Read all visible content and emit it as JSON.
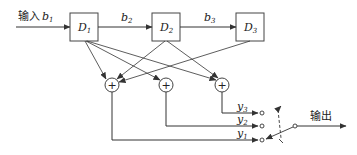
{
  "diagram": {
    "input_label": "输入",
    "input_var": "b",
    "input_sub": "1",
    "output_label": "输出",
    "registers": [
      {
        "name": "D",
        "sub": "1"
      },
      {
        "name": "D",
        "sub": "2"
      },
      {
        "name": "D",
        "sub": "3"
      }
    ],
    "links": [
      {
        "var": "b",
        "sub": "2"
      },
      {
        "var": "b",
        "sub": "3"
      }
    ],
    "adder_symbol": "+",
    "outputs": [
      {
        "var": "y",
        "sub": "3"
      },
      {
        "var": "y",
        "sub": "2"
      },
      {
        "var": "y",
        "sub": "1"
      }
    ],
    "colors": {
      "line": "#333333",
      "background": "#ffffff"
    }
  }
}
